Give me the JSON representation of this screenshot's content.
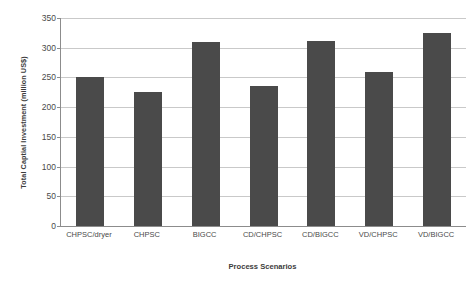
{
  "chart_data": {
    "type": "bar",
    "title": "",
    "xlabel": "Process Scenarios",
    "ylabel": "Total Captial Investment (million US$)",
    "categories": [
      "CHPSC/dryer",
      "CHPSC",
      "BIGCC",
      "CD/CHPSC",
      "CD/BIGCC",
      "VD/CHPSC",
      "VD/BIGCC"
    ],
    "values": [
      250,
      226,
      309,
      236,
      312,
      259,
      324
    ],
    "ylim": [
      0,
      350
    ],
    "ytick_labels": [
      "0",
      "50",
      "100",
      "150",
      "200",
      "250",
      "300",
      "350"
    ],
    "ytick_values": [
      0,
      50,
      100,
      150,
      200,
      250,
      300,
      350
    ],
    "grid": true,
    "legend": "none",
    "bar_color": "#4a4a4a",
    "gridline_color": "#c9c9c9",
    "axis_color": "#8c8c8c",
    "background_color": "#ffffff"
  }
}
